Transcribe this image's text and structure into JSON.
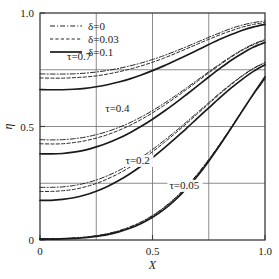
{
  "chart_data": {
    "type": "line",
    "title": "",
    "xlabel": "X",
    "ylabel": "η",
    "xlim": [
      0,
      1
    ],
    "ylim": [
      0,
      1
    ],
    "xticks": [
      0,
      0.5,
      1.0
    ],
    "xticklabels": [
      "0",
      "0.5",
      "1.0"
    ],
    "yticks": [
      0,
      0.5,
      1.0
    ],
    "yticklabels": [
      "0",
      "0.5",
      "1.0"
    ],
    "grid": true,
    "gridlines_x": [
      0.25,
      0.5,
      0.75
    ],
    "gridlines_y": [
      0.25,
      0.5,
      0.75
    ],
    "legend_position": "upper-left",
    "legend": [
      {
        "label": "δ=0",
        "style": "dashdot"
      },
      {
        "label": "δ=0.03",
        "style": "dashed"
      },
      {
        "label": "δ=0.1",
        "style": "solid"
      }
    ],
    "annotations": [
      {
        "text": "τ=0.7",
        "x": 0.12,
        "y": 0.795
      },
      {
        "text": "τ=0.4",
        "x": 0.29,
        "y": 0.565
      },
      {
        "text": "τ=0.2",
        "x": 0.38,
        "y": 0.335
      },
      {
        "text": "τ=0.05",
        "x": 0.575,
        "y": 0.225
      }
    ],
    "x": [
      0,
      0.05,
      0.1,
      0.15,
      0.2,
      0.25,
      0.3,
      0.35,
      0.4,
      0.45,
      0.5,
      0.55,
      0.6,
      0.65,
      0.7,
      0.75,
      0.8,
      0.85,
      0.9,
      0.95,
      1.0
    ],
    "series": [
      {
        "name": "τ=0.7, δ=0",
        "tau": 0.7,
        "delta": 0,
        "style": "dashdot",
        "values": [
          0.732,
          0.731,
          0.731,
          0.732,
          0.735,
          0.74,
          0.747,
          0.756,
          0.767,
          0.78,
          0.795,
          0.812,
          0.831,
          0.851,
          0.872,
          0.893,
          0.913,
          0.932,
          0.947,
          0.958,
          0.965
        ]
      },
      {
        "name": "τ=0.7, δ=0.03",
        "tau": 0.7,
        "delta": 0.03,
        "style": "dashed",
        "values": [
          0.714,
          0.713,
          0.713,
          0.715,
          0.718,
          0.723,
          0.731,
          0.741,
          0.753,
          0.767,
          0.783,
          0.801,
          0.821,
          0.842,
          0.863,
          0.884,
          0.904,
          0.922,
          0.938,
          0.95,
          0.958
        ]
      },
      {
        "name": "τ=0.7, δ=0.1",
        "tau": 0.7,
        "delta": 0.1,
        "style": "solid",
        "values": [
          0.663,
          0.662,
          0.662,
          0.664,
          0.668,
          0.675,
          0.684,
          0.696,
          0.71,
          0.727,
          0.746,
          0.767,
          0.79,
          0.813,
          0.837,
          0.861,
          0.884,
          0.905,
          0.924,
          0.939,
          0.95
        ]
      },
      {
        "name": "τ=0.4, δ=0",
        "tau": 0.4,
        "delta": 0,
        "style": "dashdot",
        "values": [
          0.442,
          0.441,
          0.442,
          0.446,
          0.453,
          0.464,
          0.478,
          0.496,
          0.517,
          0.542,
          0.57,
          0.601,
          0.634,
          0.669,
          0.705,
          0.741,
          0.776,
          0.809,
          0.839,
          0.864,
          0.883
        ]
      },
      {
        "name": "τ=0.4, δ=0.03",
        "tau": 0.4,
        "delta": 0.03,
        "style": "dashed",
        "values": [
          0.424,
          0.423,
          0.424,
          0.429,
          0.437,
          0.449,
          0.464,
          0.483,
          0.505,
          0.531,
          0.56,
          0.592,
          0.626,
          0.662,
          0.699,
          0.736,
          0.772,
          0.806,
          0.836,
          0.861,
          0.88
        ]
      },
      {
        "name": "τ=0.4, δ=0.1",
        "tau": 0.4,
        "delta": 0.1,
        "style": "solid",
        "values": [
          0.38,
          0.379,
          0.381,
          0.387,
          0.396,
          0.41,
          0.427,
          0.448,
          0.473,
          0.501,
          0.532,
          0.566,
          0.602,
          0.64,
          0.679,
          0.718,
          0.756,
          0.792,
          0.823,
          0.85,
          0.87
        ]
      },
      {
        "name": "τ=0.2, δ=0",
        "tau": 0.2,
        "delta": 0,
        "style": "dashdot",
        "values": [
          0.232,
          0.232,
          0.234,
          0.24,
          0.25,
          0.264,
          0.283,
          0.306,
          0.333,
          0.364,
          0.399,
          0.437,
          0.477,
          0.519,
          0.562,
          0.605,
          0.648,
          0.688,
          0.725,
          0.757,
          0.782
        ]
      },
      {
        "name": "τ=0.2, δ=0.03",
        "tau": 0.2,
        "delta": 0.03,
        "style": "dashed",
        "values": [
          0.214,
          0.214,
          0.217,
          0.223,
          0.234,
          0.249,
          0.269,
          0.293,
          0.321,
          0.353,
          0.389,
          0.428,
          0.469,
          0.512,
          0.556,
          0.6,
          0.644,
          0.685,
          0.723,
          0.756,
          0.781
        ]
      },
      {
        "name": "τ=0.2, δ=0.1",
        "tau": 0.2,
        "delta": 0.1,
        "style": "solid",
        "values": [
          0.175,
          0.175,
          0.179,
          0.186,
          0.198,
          0.215,
          0.236,
          0.262,
          0.292,
          0.326,
          0.363,
          0.404,
          0.447,
          0.491,
          0.537,
          0.582,
          0.627,
          0.67,
          0.709,
          0.744,
          0.772
        ]
      },
      {
        "name": "τ=0.05, δ=0",
        "tau": 0.05,
        "delta": 0,
        "style": "dashdot",
        "values": [
          0.006,
          0.006,
          0.007,
          0.009,
          0.013,
          0.019,
          0.028,
          0.041,
          0.058,
          0.08,
          0.108,
          0.143,
          0.185,
          0.234,
          0.291,
          0.355,
          0.424,
          0.497,
          0.57,
          0.642,
          0.707
        ]
      },
      {
        "name": "τ=0.05, δ=0.03",
        "tau": 0.05,
        "delta": 0.03,
        "style": "dashed",
        "values": [
          0.005,
          0.005,
          0.006,
          0.008,
          0.012,
          0.018,
          0.027,
          0.039,
          0.056,
          0.078,
          0.106,
          0.141,
          0.183,
          0.232,
          0.289,
          0.353,
          0.423,
          0.496,
          0.571,
          0.644,
          0.712
        ]
      },
      {
        "name": "τ=0.05, δ=0.1",
        "tau": 0.05,
        "delta": 0.1,
        "style": "solid",
        "values": [
          0.004,
          0.004,
          0.005,
          0.007,
          0.01,
          0.016,
          0.024,
          0.036,
          0.052,
          0.073,
          0.1,
          0.134,
          0.176,
          0.225,
          0.282,
          0.347,
          0.418,
          0.493,
          0.57,
          0.646,
          0.718
        ]
      }
    ]
  }
}
